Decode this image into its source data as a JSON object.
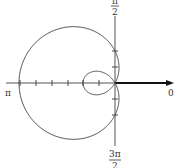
{
  "chart_data": {
    "type": "line",
    "subtype": "polar",
    "title": "",
    "equation": "r = 2 - 4cos(θ)",
    "angle_labels": {
      "right": "0",
      "top": "π/2",
      "left": "π",
      "bottom": "3π/2"
    },
    "labels": {
      "right": "0",
      "left": "π",
      "top_num": "π",
      "top_den": "2",
      "bottom_num": "3π",
      "bottom_den": "2"
    },
    "polar_axis_ticks": [
      1,
      2,
      3,
      4,
      5,
      6
    ],
    "vertical_ticks": [
      -2,
      -1,
      1,
      2
    ],
    "key_points": [
      {
        "theta": "0",
        "r": -2
      },
      {
        "theta": "π/2",
        "r": 2
      },
      {
        "theta": "π",
        "r": 6
      },
      {
        "theta": "3π/2",
        "r": 2
      }
    ],
    "features": [
      "outer loop",
      "inner loop",
      "polar axis arrow"
    ],
    "grid": false
  }
}
